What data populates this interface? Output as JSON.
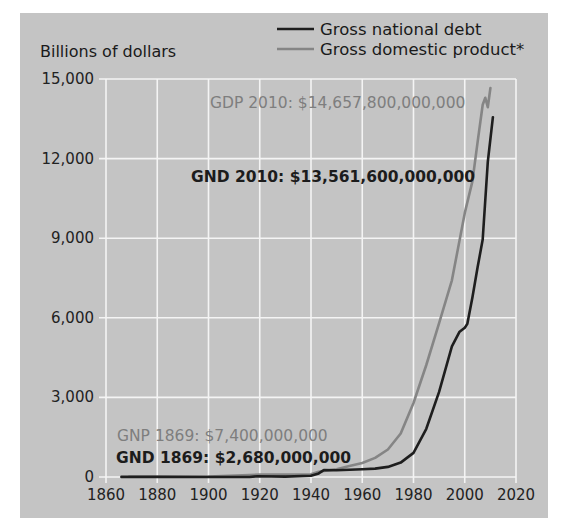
{
  "chart_data": {
    "type": "line",
    "title": "",
    "ylabel": "Billions of dollars",
    "xlabel": "",
    "xlim": [
      1860,
      2020
    ],
    "ylim": [
      0,
      15000
    ],
    "x_ticks": [
      1860,
      1880,
      1900,
      1920,
      1940,
      1960,
      1980,
      2000,
      2020
    ],
    "y_ticks": [
      0,
      3000,
      6000,
      9000,
      12000,
      15000
    ],
    "x_tick_labels": [
      "1860",
      "1880",
      "1900",
      "1920",
      "1940",
      "1960",
      "1980",
      "2000",
      "2020"
    ],
    "y_tick_labels": [
      "0",
      "3,000",
      "6,000",
      "9,000",
      "12,000",
      "15,000"
    ],
    "grid": true,
    "legend_position": "top-right",
    "series": [
      {
        "name": "Gross national debt",
        "color": "#1e1e1e",
        "x": [
          1866,
          1869,
          1880,
          1900,
          1916,
          1919,
          1930,
          1940,
          1943,
          1945,
          1950,
          1960,
          1965,
          1970,
          1975,
          1980,
          1985,
          1990,
          1995,
          1998,
          2000,
          2001,
          2003,
          2005,
          2007,
          2009,
          2011
        ],
        "y": [
          2.7,
          2.68,
          2.1,
          1.3,
          1.2,
          25.5,
          16.2,
          50.7,
          136,
          260,
          257,
          290,
          317,
          380,
          542,
          909,
          1817,
          3206,
          4921,
          5478,
          5628,
          5769,
          6760,
          7905,
          8950,
          11876,
          13562
        ]
      },
      {
        "name": "Gross domestic product*",
        "color": "#858585",
        "x": [
          1869,
          1880,
          1900,
          1920,
          1930,
          1940,
          1943,
          1945,
          1950,
          1955,
          1960,
          1965,
          1970,
          1975,
          1980,
          1985,
          1990,
          1995,
          2000,
          2003,
          2005,
          2007,
          2008,
          2009,
          2010
        ],
        "y": [
          7.4,
          10,
          20,
          90,
          92,
          101,
          200,
          228,
          294,
          415,
          526,
          719,
          1038,
          1638,
          2789,
          4220,
          5800,
          7415,
          9952,
          11142,
          12623,
          14029,
          14292,
          13939,
          14658
        ]
      }
    ],
    "annotations": [
      {
        "text": "GDP 2010: $14,657,800,000,000",
        "series": "Gross domestic product*"
      },
      {
        "text": "GND 2010: $13,561,600,000,000",
        "series": "Gross national debt"
      },
      {
        "text": "GNP 1869: $7,400,000,000",
        "series": "Gross domestic product*"
      },
      {
        "text": "GND 1869: $2,680,000,000",
        "series": "Gross national debt"
      }
    ]
  },
  "labels": {
    "y_axis_title": "Billions of dollars",
    "legend_debt": "Gross national debt",
    "legend_gdp": "Gross domestic product*",
    "anno_gdp_2010": "GDP 2010: $14,657,800,000,000",
    "anno_gnd_2010": "GND 2010: $13,561,600,000,000",
    "anno_gnp_1869": "GNP 1869: $7,400,000,000",
    "anno_gnd_1869": "GND 1869: $2,680,000,000"
  }
}
